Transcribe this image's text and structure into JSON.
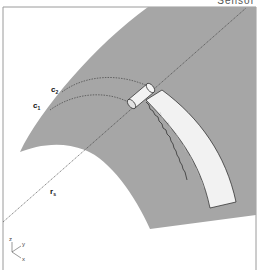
{
  "header": {
    "cropped_text": "Sensor"
  },
  "diagram": {
    "labels": {
      "c2": {
        "main": "c",
        "sub": "2"
      },
      "c1": {
        "main": "c",
        "sub": "1"
      },
      "rs": {
        "main": "r",
        "sub": "s"
      }
    },
    "axes": {
      "z": "z",
      "y": "y",
      "x": "x"
    },
    "colors": {
      "surface": "#a6a6a6",
      "band": "#f2f2f2",
      "frame": "#9a9a9a",
      "dashed_line": "#333333"
    }
  }
}
